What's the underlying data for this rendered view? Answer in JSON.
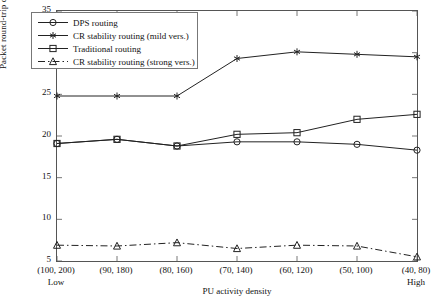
{
  "chart_data": {
    "type": "line",
    "title": "",
    "xlabel": "PU activity density",
    "ylabel": "Packet round-trip delay (ms)",
    "categories": [
      "(100, 200)",
      "(90, 180)",
      "(80, 160)",
      "(70, 140)",
      "(60, 120)",
      "(50, 100)",
      "(40, 80)"
    ],
    "x_end_labels": {
      "left": "Low",
      "right": "High"
    },
    "ylim": [
      5,
      35
    ],
    "yticks": [
      5,
      10,
      15,
      20,
      25,
      30,
      35
    ],
    "grid": false,
    "legend_position": "upper-left",
    "series": [
      {
        "name": "DPS routing",
        "marker": "circle",
        "line": "solid",
        "color": "#222222",
        "values": [
          19.1,
          19.6,
          18.8,
          19.3,
          19.3,
          19.0,
          18.3
        ]
      },
      {
        "name": "CR stability routing (mild vers.)",
        "marker": "asterisk",
        "line": "solid",
        "color": "#222222",
        "values": [
          24.8,
          24.8,
          24.8,
          29.3,
          30.1,
          29.8,
          29.5
        ]
      },
      {
        "name": "Traditional routing",
        "marker": "square",
        "line": "solid",
        "color": "#222222",
        "values": [
          19.1,
          19.6,
          18.8,
          20.2,
          20.4,
          22.0,
          22.6
        ]
      },
      {
        "name": "CR stability routing (strong vers.)",
        "marker": "triangle",
        "line": "dash-dot",
        "color": "#222222",
        "values": [
          6.9,
          6.8,
          7.2,
          6.5,
          6.9,
          6.8,
          5.5
        ]
      }
    ]
  },
  "axes": {
    "y_title": "Packet round-trip delay (ms)",
    "x_title": "PU activity density",
    "y_tick_labels": [
      "35",
      "30",
      "25",
      "20",
      "15",
      "10",
      "5"
    ],
    "x_tick_labels": [
      "(100, 200)",
      "(90, 180)",
      "(80, 160)",
      "(70, 140)",
      "(60, 120)",
      "(50, 100)",
      "(40, 80)"
    ],
    "x_left_end": "Low",
    "x_right_end": "High"
  },
  "legend": {
    "items": [
      {
        "label": "DPS routing",
        "marker": "circle-marker",
        "line": "solid"
      },
      {
        "label": "CR stability routing (mild vers.)",
        "marker": "asterisk-marker",
        "line": "solid"
      },
      {
        "label": "Traditional routing",
        "marker": "square-marker",
        "line": "solid"
      },
      {
        "label": "CR stability routing (strong vers.)",
        "marker": "triangle-marker",
        "line": "dash-dot"
      }
    ]
  }
}
